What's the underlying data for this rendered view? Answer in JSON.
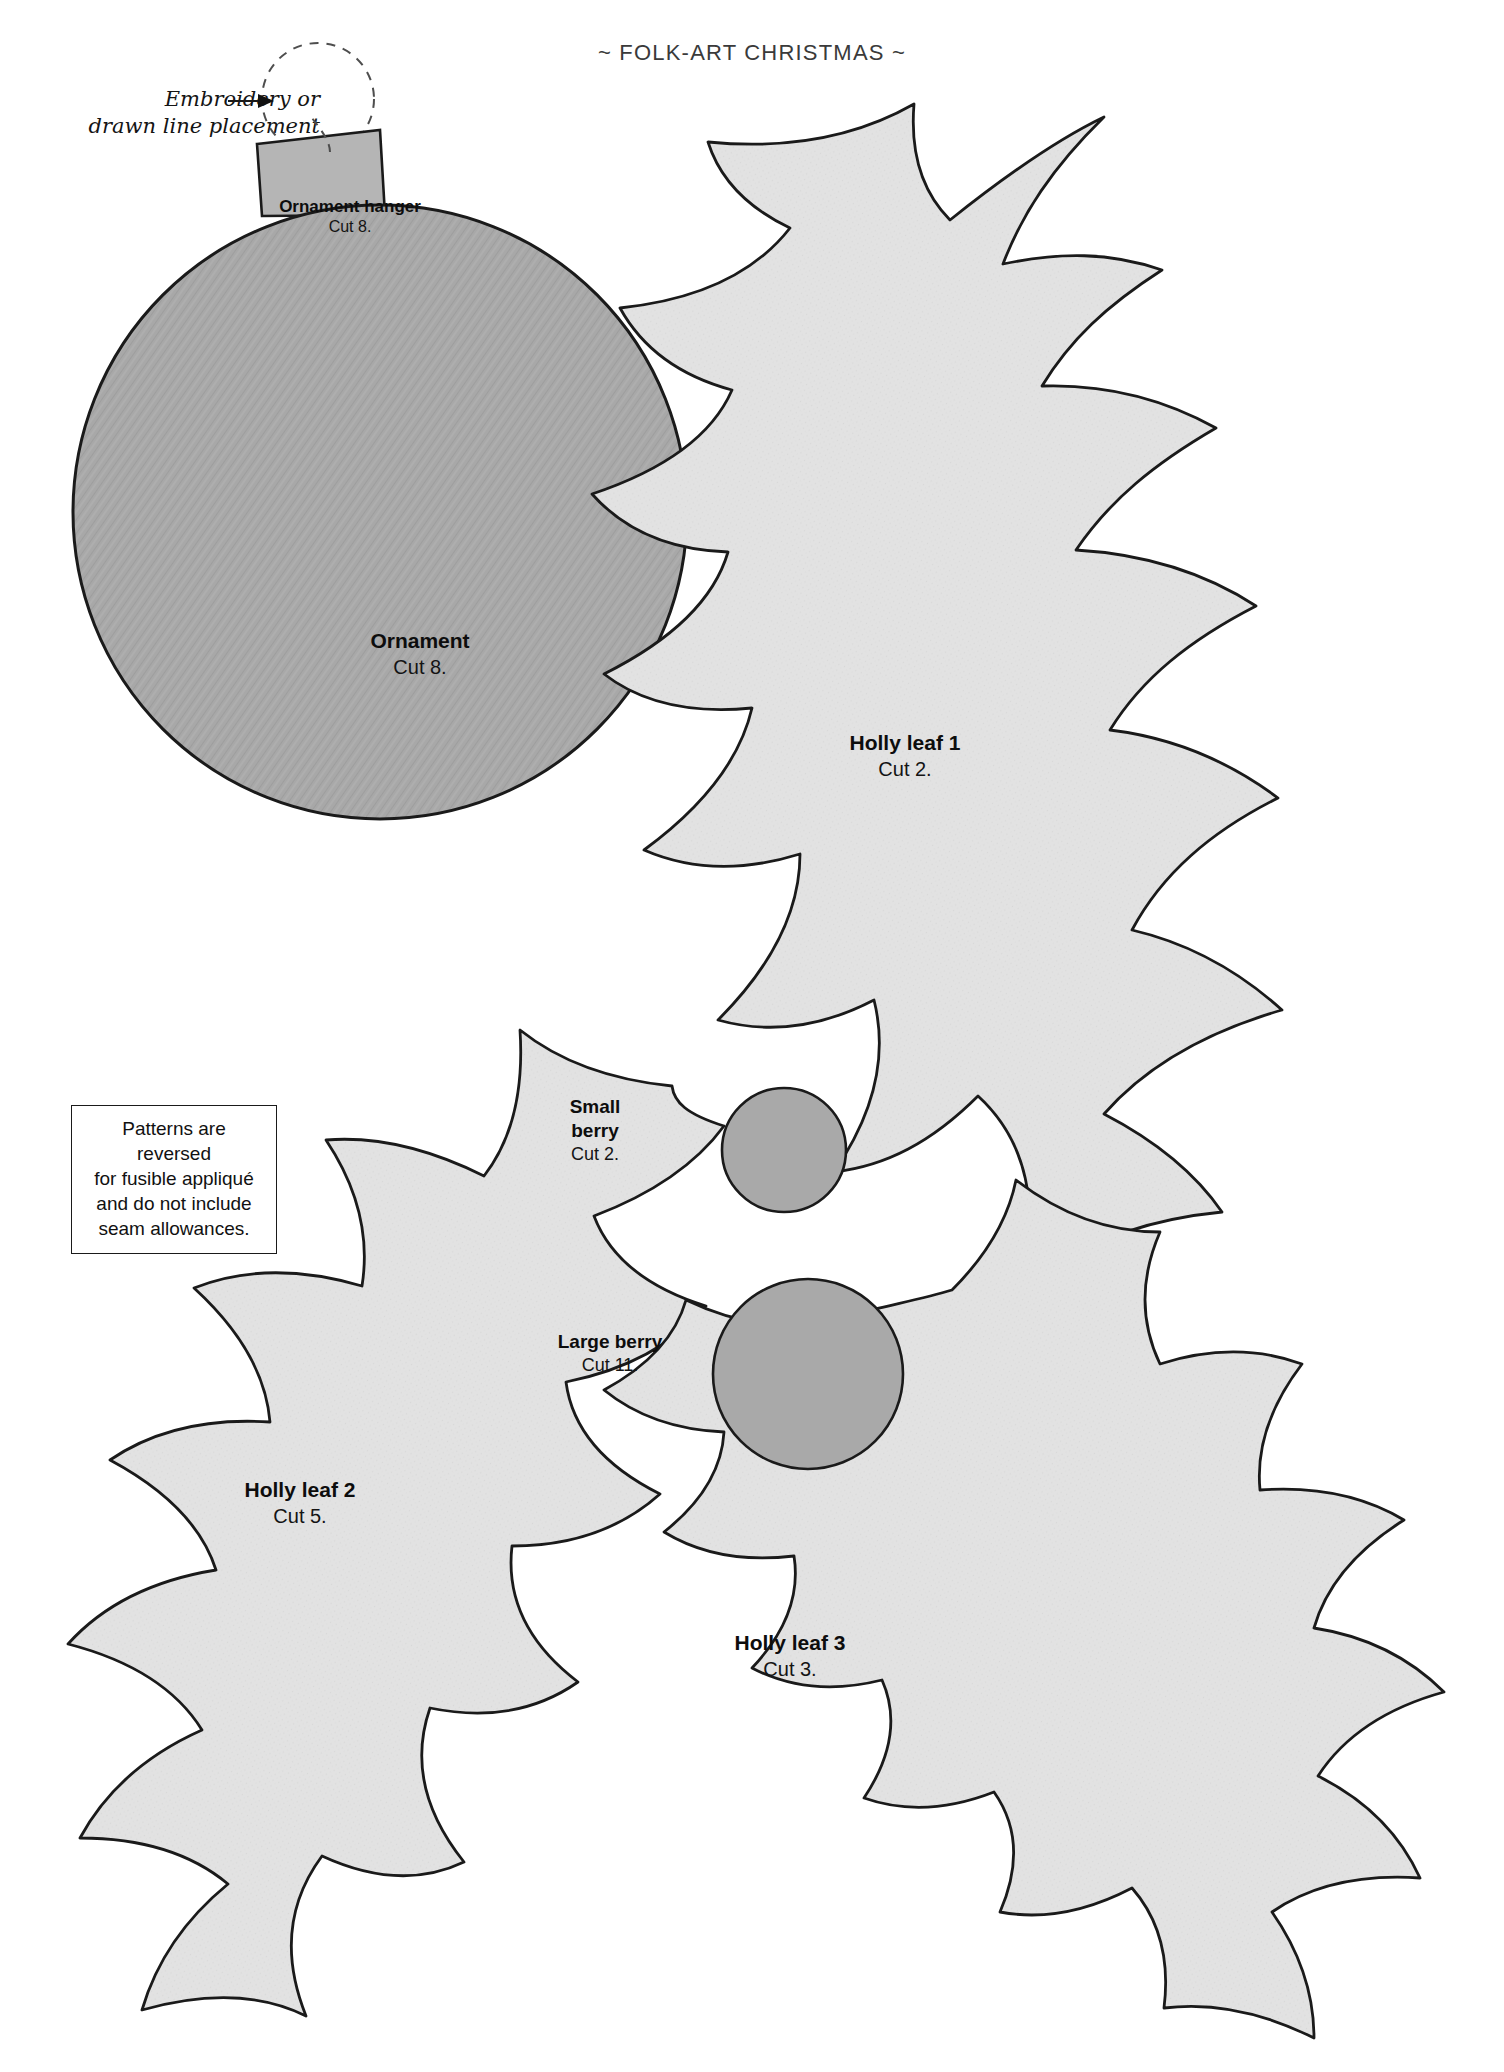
{
  "page": {
    "header": "~ FOLK-ART CHRISTMAS ~",
    "footer": "~ 57 ~",
    "page_number": "57"
  },
  "annotation": {
    "line1": "Embroidery or",
    "line2": "drawn line placement",
    "target": "dashed-circle-ornament-hanger-loop"
  },
  "note_box": {
    "line1": "Patterns are reversed",
    "line2": "for fusible appliqué",
    "line3": "and do not include",
    "line4": "seam allowances."
  },
  "pieces": [
    {
      "id": "ornament-hanger",
      "name": "Ornament hanger",
      "cut": "Cut 8."
    },
    {
      "id": "ornament",
      "name": "Ornament",
      "cut": "Cut 8."
    },
    {
      "id": "holly-leaf-1",
      "name": "Holly leaf 1",
      "cut": "Cut 2."
    },
    {
      "id": "holly-leaf-2",
      "name": "Holly leaf 2",
      "cut": "Cut 5."
    },
    {
      "id": "holly-leaf-3",
      "name": "Holly leaf 3",
      "cut": "Cut 3."
    },
    {
      "id": "small-berry",
      "name": "Small berry",
      "cut": "Cut 2."
    },
    {
      "id": "large-berry",
      "name": "Large berry",
      "cut": "Cut 11."
    }
  ],
  "colors": {
    "page_background": "#ffffff",
    "ornament_fill": "#a8a8a8",
    "berry_fill": "#a8a8a8",
    "leaf_fill": "#e2e2e2",
    "hanger_fill": "#b5b5b5",
    "outline": "#1a1a1a",
    "dashed_guide": "#555555",
    "header_text": "#3a3a3a",
    "body_text": "#111111"
  }
}
